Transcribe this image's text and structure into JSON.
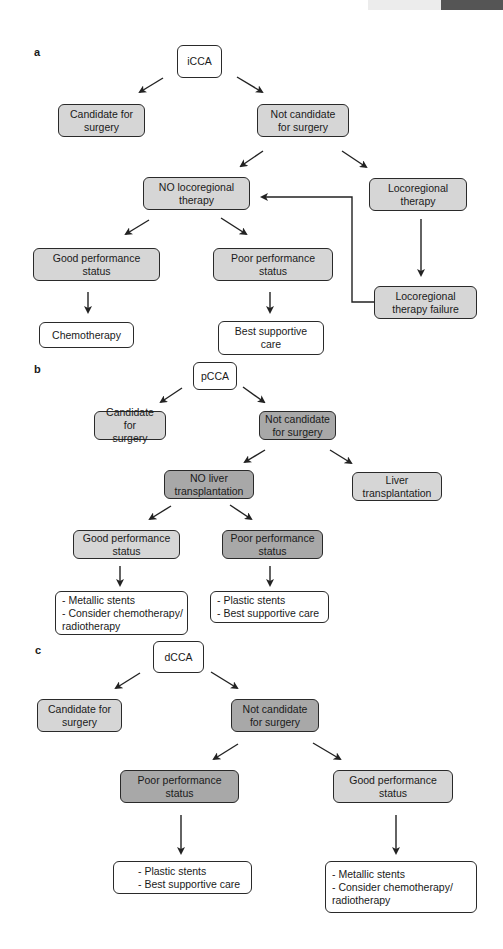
{
  "header_bar": {
    "light_color": "#ececec",
    "dark_color": "#555555"
  },
  "panels": [
    {
      "label": "a",
      "root": "iCCA",
      "nodes": {
        "candidate": "Candidate for\nsurgery",
        "not_candidate": "Not candidate\nfor surgery",
        "no_locoregional": "NO locoregional\ntherapy",
        "locoregional": "Locoregional\ntherapy",
        "good_ps": "Good performance\nstatus",
        "poor_ps": "Poor performance\nstatus",
        "locoregional_failure": "Locoregional\ntherapy failure",
        "chemotherapy": "Chemotherapy",
        "best_supportive": "Best supportive\ncare"
      }
    },
    {
      "label": "b",
      "root": "pCCA",
      "nodes": {
        "candidate": "Candidate for\nsurgery",
        "not_candidate": "Not candidate\nfor surgery",
        "no_liver_tx": "NO liver\ntransplantation",
        "liver_tx": "Liver\ntransplantation",
        "good_ps": "Good performance\nstatus",
        "poor_ps": "Poor performance\nstatus",
        "good_outcome": "- Metallic stents\n- Consider chemotherapy/\nradiotherapy",
        "poor_outcome": "- Plastic stents\n- Best supportive care"
      }
    },
    {
      "label": "c",
      "root": "dCCA",
      "nodes": {
        "candidate": "Candidate for\nsurgery",
        "not_candidate": "Not candidate\nfor surgery",
        "poor_ps": "Poor performance\nstatus",
        "good_ps": "Good performance\nstatus",
        "poor_outcome": "- Plastic stents\n- Best supportive care",
        "good_outcome": "- Metallic stents\n- Consider chemotherapy/\nradiotherapy"
      }
    }
  ],
  "colors": {
    "white": "#ffffff",
    "light_gray": "#d6d6d6",
    "dark_gray": "#a8a8a8",
    "stroke": "#2a2a2a"
  }
}
